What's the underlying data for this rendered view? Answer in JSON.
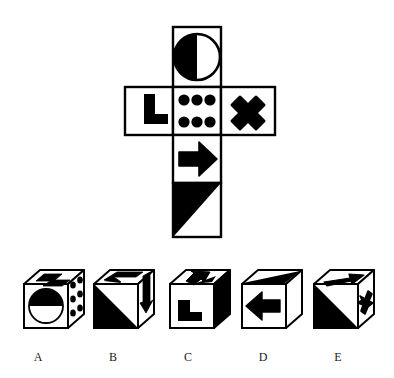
{
  "puzzle": {
    "type": "cube-folding-visual-reasoning",
    "net": {
      "description": "Unfolded cube net in cross/T shape with six square faces",
      "origin": {
        "x": 125,
        "y": 27
      },
      "cell": 48,
      "stroke": "#000000",
      "fill": "#ffffff",
      "faces": [
        {
          "id": "top-circle",
          "name": "half-filled-circle-face",
          "col": 1,
          "row": 0,
          "symbol": "half-circle",
          "symbol_desc": "circle with left half solid black, right half white outline"
        },
        {
          "id": "left-ell",
          "name": "l-shape-face",
          "col": 0,
          "row": 1,
          "symbol": "l-shape",
          "symbol_desc": "thick black L / corner bracket"
        },
        {
          "id": "center-dots",
          "name": "six-dots-face",
          "col": 1,
          "row": 1,
          "symbol": "six-dots",
          "symbol_desc": "six black dots in two rows of three"
        },
        {
          "id": "right-cross",
          "name": "x-cross-face",
          "col": 2,
          "row": 1,
          "symbol": "x-cross",
          "symbol_desc": "bold black X / saltire cross"
        },
        {
          "id": "arrow-face",
          "name": "right-arrow-face",
          "col": 1,
          "row": 2,
          "symbol": "arrow-right",
          "symbol_desc": "solid black arrow pointing right"
        },
        {
          "id": "triangle-face",
          "name": "triangle-face",
          "col": 1,
          "row": 3,
          "symbol": "triangle",
          "symbol_desc": "black right triangle filling upper-left half, hypotenuse from top-right to bottom-left"
        }
      ]
    },
    "options": {
      "count": 5,
      "baseline_y": 358,
      "items": [
        {
          "label": "A",
          "name": "option-cube-a",
          "label_x": 38,
          "label_y": 358,
          "cube_x": 22,
          "cube_y": 272,
          "faces": {
            "front": {
              "symbol": "half-circle-horizontal",
              "desc": "circle with upper half black, lower half white"
            },
            "top": {
              "symbol": "z-shape",
              "desc": "angular black Z / L bracket"
            },
            "right": {
              "symbol": "dots",
              "desc": "black dots"
            }
          }
        },
        {
          "label": "B",
          "name": "option-cube-b",
          "label_x": 113,
          "label_y": 358,
          "cube_x": 92,
          "cube_y": 272,
          "faces": {
            "front": {
              "symbol": "triangle",
              "desc": "black triangle filling lower-left half"
            },
            "top": {
              "symbol": "band",
              "desc": "angular black band"
            },
            "right": {
              "symbol": "arrow-down",
              "desc": "black arrow pointing down"
            }
          }
        },
        {
          "label": "C",
          "name": "option-cube-c",
          "label_x": 188,
          "label_y": 358,
          "cube_x": 168,
          "cube_y": 272,
          "faces": {
            "front": {
              "symbol": "l-shape",
              "desc": "black L bracket"
            },
            "top": {
              "symbol": "arrow-up-left",
              "desc": "black arrow pointing up and left"
            },
            "right": {
              "symbol": "solid-black",
              "desc": "completely filled black face"
            }
          }
        },
        {
          "label": "D",
          "name": "option-cube-d",
          "label_x": 263,
          "label_y": 358,
          "cube_x": 240,
          "cube_y": 272,
          "faces": {
            "front": {
              "symbol": "arrow-left",
              "desc": "black arrow pointing left"
            },
            "top": {
              "symbol": "triangle",
              "desc": "black triangle on top face"
            },
            "right": {
              "symbol": "blank",
              "desc": "plain white face"
            }
          }
        },
        {
          "label": "E",
          "name": "option-cube-e",
          "label_x": 338,
          "label_y": 358,
          "cube_x": 312,
          "cube_y": 272,
          "faces": {
            "front": {
              "symbol": "triangle",
              "desc": "black triangle filling lower-left half"
            },
            "top": {
              "symbol": "arrow-right",
              "desc": "black arrow pointing right"
            },
            "right": {
              "symbol": "x-cross",
              "desc": "black X cross"
            }
          }
        }
      ]
    },
    "colors": {
      "ink": "#000000",
      "paper": "#ffffff",
      "label_ink": "#1a1a1a"
    }
  }
}
